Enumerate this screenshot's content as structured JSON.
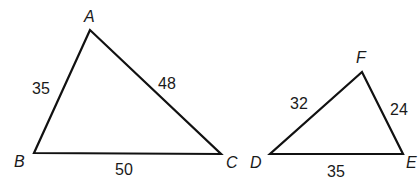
{
  "triangles": [
    {
      "name": "ABC",
      "vertices": {
        "A": [
          90,
          30
        ],
        "B": [
          34,
          153
        ],
        "C": [
          221,
          154
        ]
      },
      "vertex_labels": {
        "A": "A",
        "B": "B",
        "C": "C"
      },
      "side_labels": {
        "AB": "35",
        "AC": "48",
        "BC": "50"
      }
    },
    {
      "name": "DEF",
      "vertices": {
        "D": [
          270,
          154
        ],
        "E": [
          403,
          154
        ],
        "F": [
          362,
          72
        ]
      },
      "vertex_labels": {
        "D": "D",
        "E": "E",
        "F": "F"
      },
      "side_labels": {
        "DF": "32",
        "FE": "24",
        "DE": "35"
      }
    }
  ],
  "colors": {
    "stroke": "#111111",
    "text": "#1a1a1a",
    "background": "#ffffff"
  }
}
